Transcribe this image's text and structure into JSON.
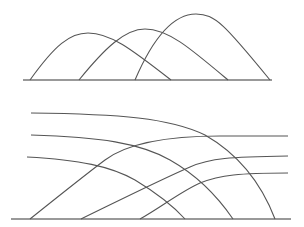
{
  "diagram": {
    "colors": {
      "stroke": "#555555",
      "baseline": "#777777",
      "background": "#ffffff"
    },
    "top_panel": {
      "description": "Three overlapping hump-shaped curves on a common baseline",
      "baseline": {
        "x1": 23,
        "x2": 272,
        "y": 80
      },
      "curves": [
        {
          "id": "hump-1",
          "path": "M30,80 C55,45 70,33 88,33 C110,33 130,48 171,80"
        },
        {
          "id": "hump-2",
          "path": "M79,80 C105,48 125,29 145,29 C168,29 190,48 228,80"
        },
        {
          "id": "hump-3",
          "path": "M135,80 C150,45 170,14 196,14 C215,14 225,25 270,80"
        }
      ]
    },
    "bottom_panel": {
      "description": "Three decreasing curves crossing three increasing curves on a common baseline",
      "baseline": {
        "x1": 11,
        "x2": 291,
        "y": 219
      },
      "decreasing_curves": [
        {
          "id": "down-1",
          "path": "M31,113 C120,114 170,118 205,135 C240,155 262,185 275,219"
        },
        {
          "id": "down-2",
          "path": "M31,135 C100,137 140,143 170,160 C200,177 220,200 233,219"
        },
        {
          "id": "down-3",
          "path": "M27,157 C80,160 110,166 135,180 C160,195 175,208 185,219"
        }
      ],
      "increasing_curves": [
        {
          "id": "up-1",
          "path": "M30,219 C60,195 85,175 105,160 C125,145 160,136 220,136 L288,136"
        },
        {
          "id": "up-2",
          "path": "M81,219 C120,200 160,180 190,167 C210,158 230,157 288,156"
        },
        {
          "id": "up-3",
          "path": "M140,219 C160,208 180,192 200,183 C220,175 240,173 288,173"
        }
      ]
    }
  }
}
